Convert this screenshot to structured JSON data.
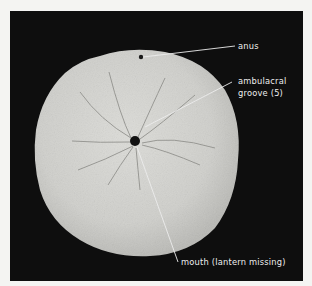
{
  "figure": {
    "background_color": "#0e0e0e",
    "specimen_color": "#cfcfcb",
    "labels": [
      {
        "id": "anus",
        "text": "anus"
      },
      {
        "id": "ambulacral-groove",
        "line1": "ambulacral",
        "line2": "groove (5)"
      },
      {
        "id": "mouth",
        "text": "mouth (lantern missing)"
      }
    ]
  }
}
